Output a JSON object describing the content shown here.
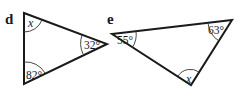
{
  "diagram": {
    "triangles": [
      {
        "label": "d",
        "angles": [
          {
            "vertex": "top",
            "text": "x"
          },
          {
            "vertex": "right",
            "text": "32°"
          },
          {
            "vertex": "bottom",
            "text": "82°"
          }
        ]
      },
      {
        "label": "e",
        "angles": [
          {
            "vertex": "left",
            "text": "55°"
          },
          {
            "vertex": "top-right",
            "text": "63°"
          },
          {
            "vertex": "bottom",
            "text": "x"
          }
        ]
      }
    ]
  }
}
